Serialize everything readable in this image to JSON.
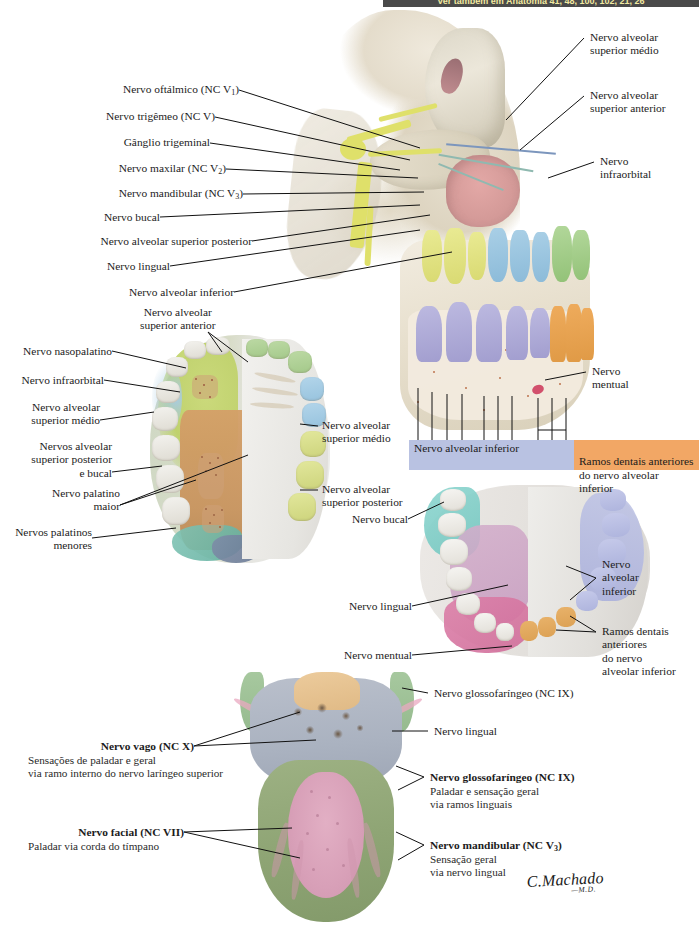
{
  "plate": {
    "banner_text": "Ver também em Anatomia 41, 48, 100, 102, 21, 26",
    "signature": "C.Machado",
    "signature_suffix": "—M.D."
  },
  "figure_maxilla_mandible_sagittal": {
    "labels_left": [
      "Nervo oftálmico (NC V₁)",
      "Nervo trigêmeo (NC V)",
      "Gânglio trigeminal",
      "Nervo maxilar (NC V₂)",
      "Nervo mandibular (NC V₃)",
      "Nervo bucal",
      "Nervo alveolar superior posterior",
      "Nervo lingual",
      "Nervo alveolar inferior"
    ],
    "labels_right": [
      "Nervo alveolar\nsuperior médio",
      "Nervo alveolar\nsuperior anterior",
      "Nervo\ninfraorbital",
      "Nervo\nmentual"
    ],
    "legend": [
      {
        "text": "Nervo alveolar inferior",
        "color": "#b9c2e2"
      },
      {
        "text": "Ramos dentais anteriores\ndo nervo alveolar inferior",
        "color": "#f2a765"
      }
    ],
    "tooth_colors": {
      "superior_medio": "#e9ea93",
      "superior_posterior": "#a9cfe6",
      "superior_anterior": "#b2d79a",
      "alveolar_inferior": "#bcb9e0",
      "ramos_dentais_anteriores": "#eeab5c"
    }
  },
  "figure_palate": {
    "label_top": "Nervo alveolar\nsuperior anterior",
    "labels_left": [
      "Nervo nasopalatino",
      "Nervo infraorbital",
      "Nervo alveolar\nsuperior médio",
      "Nervos alveolar\nsuperior posterior\ne bucal",
      "Nervo palatino\nmaior",
      "Nervos palatinos\nmenores"
    ],
    "labels_right": [
      "Nervo alveolar\nsuperior médio",
      "Nervo alveolar\nsuperior posterior"
    ]
  },
  "figure_mandible": {
    "labels_left": [
      "Nervo bucal",
      "Nervo lingual",
      "Nervo mentual"
    ],
    "labels_right": [
      "Nervo\nalveolar\ninferior",
      "Ramos dentais\nanteriores\ndo nervo\nalveolar inferior"
    ]
  },
  "figure_tongue": {
    "labels_right_simple": [
      "Nervo glossofaríngeo (NC IX)",
      "Nervo lingual"
    ],
    "labels_bold": [
      {
        "title": "Nervo vago (NC X)",
        "detail": "Sensações de paladar e geral\nvia ramo interno do nervo laríngeo superior",
        "side": "left"
      },
      {
        "title": "Nervo facial (NC VII)",
        "detail": "Paladar via corda do tímpano",
        "side": "left"
      },
      {
        "title": "Nervo glossofaríngeo (NC IX)",
        "detail": "Paladar e sensação geral\nvia ramos linguais",
        "side": "right"
      },
      {
        "title": "Nervo mandibular (NC V₃)",
        "detail": "Sensação geral\nvia nervo lingual",
        "side": "right"
      }
    ]
  }
}
